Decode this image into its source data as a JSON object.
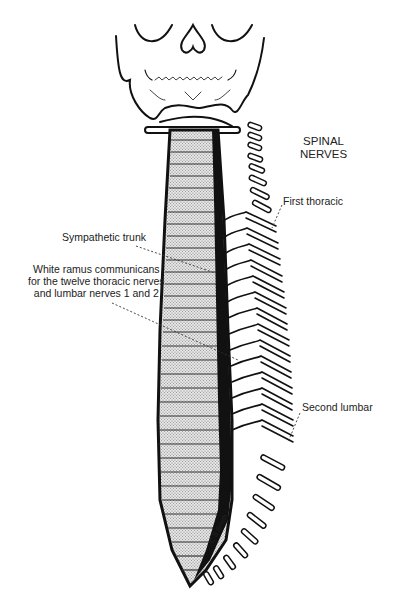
{
  "diagram": {
    "labels": {
      "spinal_nerves": [
        "SPINAL",
        "NERVES"
      ],
      "first_thoracic": "First thoracic",
      "sympathetic_trunk": "Sympathetic trunk",
      "white_ramus": [
        "White ramus communicans",
        "for the twelve thoracic nerves",
        "and lumbar nerves 1 and 2"
      ],
      "second_lumbar": "Second lumbar",
      "signature": "C S Smith"
    },
    "colors": {
      "ink": "#111111",
      "stipple": "#cfcfcf",
      "background": "#ffffff"
    }
  }
}
